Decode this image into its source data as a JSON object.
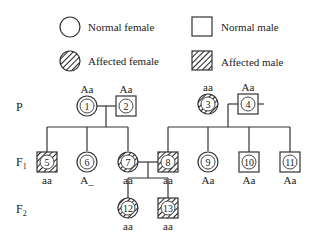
{
  "legend": {
    "normal_female": "Normal female",
    "normal_male": "Normal male",
    "affected_female": "Affected female",
    "affected_male": "Affected male"
  },
  "generations": {
    "P": "P",
    "F1": "F",
    "F1_sub": "1",
    "F2": "F",
    "F2_sub": "2"
  },
  "individuals": [
    {
      "id": "1",
      "sex": "female",
      "affected": false,
      "genotype": "Aa"
    },
    {
      "id": "2",
      "sex": "male",
      "affected": false,
      "genotype": "Aa"
    },
    {
      "id": "3",
      "sex": "female",
      "affected": true,
      "genotype": "aa"
    },
    {
      "id": "4",
      "sex": "male",
      "affected": false,
      "genotype": "Aa"
    },
    {
      "id": "5",
      "sex": "male",
      "affected": true,
      "genotype": "aa"
    },
    {
      "id": "6",
      "sex": "female",
      "affected": false,
      "genotype": "A_"
    },
    {
      "id": "7",
      "sex": "female",
      "affected": true,
      "genotype": "aa"
    },
    {
      "id": "8",
      "sex": "male",
      "affected": true,
      "genotype": "aa"
    },
    {
      "id": "9",
      "sex": "female",
      "affected": false,
      "genotype": "Aa"
    },
    {
      "id": "10",
      "sex": "male",
      "affected": false,
      "genotype": "Aa"
    },
    {
      "id": "11",
      "sex": "male",
      "affected": false,
      "genotype": "Aa"
    },
    {
      "id": "12",
      "sex": "female",
      "affected": true,
      "genotype": "aa"
    },
    {
      "id": "13",
      "sex": "male",
      "affected": true,
      "genotype": "aa"
    }
  ]
}
